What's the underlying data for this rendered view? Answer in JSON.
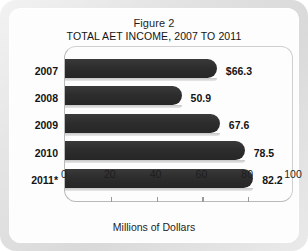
{
  "figure": {
    "title": "Figure 2",
    "subtitle": "TOTAL AET INCOME, 2007 TO 2011"
  },
  "chart_data": {
    "type": "bar",
    "orientation": "horizontal",
    "title": "Figure 2",
    "subtitle": "TOTAL AET INCOME, 2007 TO 2011",
    "categories": [
      "2007",
      "2008",
      "2009",
      "2010",
      "2011*"
    ],
    "values": [
      66.3,
      50.9,
      67.6,
      78.5,
      82.2
    ],
    "value_labels": [
      "$66.3",
      "50.9",
      "67.6",
      "78.5",
      "82.2"
    ],
    "xlabel": "Millions of Dollars",
    "ylabel": "",
    "xlim": [
      0,
      100
    ],
    "xticks": [
      0,
      20,
      40,
      60,
      80,
      100
    ],
    "xtick_labels": [
      "0",
      "20",
      "40",
      "60",
      "80",
      "100"
    ],
    "grid": false,
    "legend": null,
    "series": [
      {
        "name": "Total AET Income",
        "values": [
          66.3,
          50.9,
          67.6,
          78.5,
          82.2
        ]
      }
    ],
    "colors": {
      "bar": "#2d2d2d",
      "bar_shadow": "#cccccc",
      "text": "#141414",
      "axis": "#b9b9b9",
      "card_background": "#fdfdfd",
      "frame_background": "#e4e4e4"
    }
  }
}
